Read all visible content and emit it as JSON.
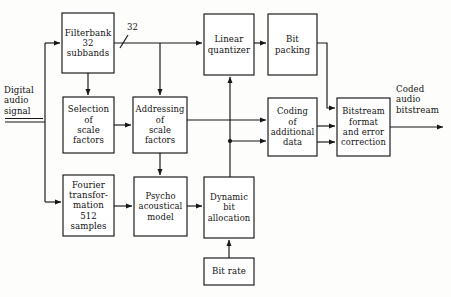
{
  "diagram": {
    "type": "block-diagram",
    "stroke_color": "#161616",
    "fill_color": "#ffffff",
    "background_color": "#fdfdfc",
    "nodes": [
      {
        "id": "filterbank",
        "label": "Filterbank\n32\nsubbands",
        "x": 62,
        "y": 13,
        "w": 52,
        "h": 60
      },
      {
        "id": "selection",
        "label": "Selection\nof\nscale\nfactors",
        "x": 63,
        "y": 97,
        "h": 56,
        "w": 51
      },
      {
        "id": "addressing",
        "label": "Addressing\nof\nscale\nfactors",
        "x": 133,
        "y": 97,
        "w": 54,
        "h": 56
      },
      {
        "id": "fourier",
        "label": "Fourier\ntransfor-\nmation\n512\nsamples",
        "x": 63,
        "y": 175,
        "w": 51,
        "h": 61
      },
      {
        "id": "psycho",
        "label": "Psycho\nacoustical\nmodel",
        "x": 134,
        "y": 177,
        "w": 53,
        "h": 59
      },
      {
        "id": "dynamic",
        "label": "Dynamic\nbit\nallocation",
        "x": 204,
        "y": 177,
        "w": 50,
        "h": 61
      },
      {
        "id": "bitrate",
        "label": "Bit rate",
        "x": 204,
        "y": 258,
        "w": 50,
        "h": 27
      },
      {
        "id": "quantizer",
        "label": "Linear\nquantizer",
        "x": 204,
        "y": 14,
        "w": 50,
        "h": 61
      },
      {
        "id": "bitpacking",
        "label": "Bit\npacking",
        "x": 268,
        "y": 14,
        "w": 49,
        "h": 61
      },
      {
        "id": "coding",
        "label": "Coding\nof\nadditional\ndata",
        "x": 268,
        "y": 98,
        "w": 49,
        "h": 58
      },
      {
        "id": "bitstream",
        "label": "Bitstream\nformat\nand  error\ncorrection",
        "x": 337,
        "y": 98,
        "w": 53,
        "h": 58
      }
    ],
    "free_labels": [
      {
        "id": "input-label",
        "text": "Digital\naudio\nsignal",
        "x": 4,
        "y": 85
      },
      {
        "id": "bus-label",
        "text": "32",
        "x": 127,
        "y": 23
      },
      {
        "id": "output-label",
        "text": "Coded\naudio\nbitstream",
        "x": 396,
        "y": 84
      }
    ],
    "annotations": {
      "bus_slash": "bus-width-slash-marker",
      "input_underline": "signal-input-underline"
    }
  }
}
